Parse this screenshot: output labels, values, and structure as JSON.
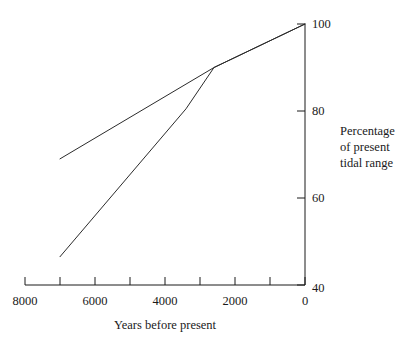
{
  "chart_data": {
    "type": "line",
    "title": "",
    "xlabel": "Years before present",
    "ylabel": "Percentage of present tidal range",
    "ylabel_lines": [
      "Percentage",
      "of present",
      "tidal range"
    ],
    "xlim": [
      8000,
      0
    ],
    "ylim": [
      40,
      100
    ],
    "x_reversed": true,
    "grid": false,
    "legend": null,
    "x_ticks_major": [
      8000,
      6000,
      4000,
      2000,
      0
    ],
    "x_tick_labels": [
      "8000",
      "6000",
      "4000",
      "2000",
      "0"
    ],
    "x_ticks_minor": [
      7000,
      5000,
      3000,
      1000
    ],
    "y_ticks_major": [
      40,
      60,
      80,
      100
    ],
    "y_tick_labels": [
      "40",
      "60",
      "80",
      "100"
    ],
    "axis_color": "#1a1a1a",
    "line_color": "#2b2b2b",
    "series": [
      {
        "name": "upper-curve",
        "x": [
          7000,
          2600,
          0
        ],
        "values": [
          69,
          90,
          100
        ]
      },
      {
        "name": "lower-curve",
        "x": [
          7000,
          3400,
          2600,
          0
        ],
        "values": [
          46.5,
          80.5,
          90,
          100
        ]
      }
    ]
  },
  "axes": {
    "x_axis_name": "years-before-present-axis",
    "y_axis_name": "percentage-tidal-range-axis"
  }
}
